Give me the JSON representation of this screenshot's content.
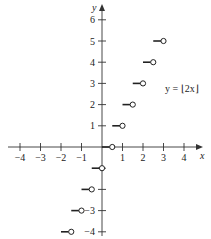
{
  "chart_data": {
    "type": "line",
    "title": "",
    "function_label": "y = ⌊2x⌋",
    "xlabel": "x",
    "ylabel": "y",
    "xlim": [
      -4.5,
      4.6
    ],
    "ylim": [
      -4.3,
      6.8
    ],
    "x_ticks": [
      -4,
      -3,
      -2,
      -1,
      1,
      2,
      3,
      4
    ],
    "x_tick_labels": [
      "−4",
      "−3",
      "−2",
      "−1",
      "1",
      "2",
      "3",
      "4"
    ],
    "y_ticks": [
      -4,
      -3,
      -2,
      -1,
      1,
      2,
      3,
      4,
      5,
      6
    ],
    "y_tick_labels": [
      "−4",
      "−3",
      "",
      "",
      "1",
      "2",
      "3",
      "4",
      "5",
      "6"
    ],
    "grid": false,
    "segments": [
      {
        "x_start": -2.0,
        "x_end": -1.5,
        "y": -4,
        "closed_start": true,
        "open_end": true
      },
      {
        "x_start": -1.5,
        "x_end": -1.0,
        "y": -3,
        "closed_start": true,
        "open_end": true
      },
      {
        "x_start": -1.0,
        "x_end": -0.5,
        "y": -2,
        "closed_start": true,
        "open_end": true
      },
      {
        "x_start": -0.5,
        "x_end": 0.0,
        "y": -1,
        "closed_start": true,
        "open_end": true
      },
      {
        "x_start": 0.0,
        "x_end": 0.5,
        "y": 0,
        "closed_start": true,
        "open_end": true
      },
      {
        "x_start": 0.5,
        "x_end": 1.0,
        "y": 1,
        "closed_start": true,
        "open_end": true
      },
      {
        "x_start": 1.0,
        "x_end": 1.5,
        "y": 2,
        "closed_start": true,
        "open_end": true
      },
      {
        "x_start": 1.5,
        "x_end": 2.0,
        "y": 3,
        "closed_start": true,
        "open_end": true
      },
      {
        "x_start": 2.0,
        "x_end": 2.5,
        "y": 4,
        "closed_start": true,
        "open_end": true
      },
      {
        "x_start": 2.5,
        "x_end": 3.0,
        "y": 5,
        "closed_start": true,
        "open_end": true
      }
    ]
  },
  "labels": {
    "x_axis": "x",
    "y_axis": "y",
    "equation": "y = ⌊2x⌋"
  }
}
